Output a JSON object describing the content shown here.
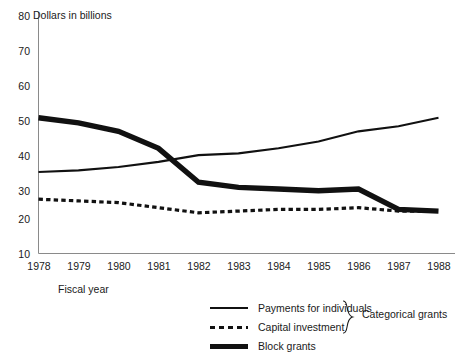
{
  "chart_data": {
    "type": "line",
    "title": "",
    "subtitle": "",
    "ylabel": "Dollars in billions",
    "xlabel": "Fiscal year",
    "x": [
      1978,
      1979,
      1980,
      1981,
      1982,
      1983,
      1984,
      1985,
      1986,
      1987,
      1988
    ],
    "categories": [
      "1978",
      "1979",
      "1980",
      "1981",
      "1982",
      "1983",
      "1984",
      "1985",
      "1986",
      "1987",
      "1988"
    ],
    "ylim": [
      10,
      80
    ],
    "yticks": [
      10,
      20,
      30,
      40,
      50,
      60,
      70,
      80
    ],
    "grid": false,
    "legend_position": "bottom-right",
    "series": [
      {
        "name": "Payments for individuals",
        "style": "solid-thin",
        "color": "#111111",
        "values": [
          34,
          34.5,
          35.5,
          37,
          39,
          39.5,
          41,
          43,
          46,
          47.5,
          50
        ]
      },
      {
        "name": "Capital investment",
        "style": "dotted",
        "color": "#111111",
        "values": [
          26,
          25.5,
          25,
          23.5,
          22,
          22.5,
          23,
          23,
          23.5,
          22.5,
          22.5
        ]
      },
      {
        "name": "Block grants",
        "style": "solid-thick",
        "color": "#111111",
        "values": [
          50,
          48.5,
          46,
          41,
          31,
          29.5,
          29,
          28.5,
          29,
          23,
          22.5
        ]
      }
    ],
    "annotations": [
      {
        "text": "Categorical grants",
        "type": "brace-group",
        "groups": [
          "Payments for individuals",
          "Capital investment"
        ]
      }
    ]
  },
  "legend": {
    "items": [
      {
        "label": "Payments for individuals",
        "style": "solid-thin"
      },
      {
        "label": "Capital investment",
        "style": "dotted"
      },
      {
        "label": "Block grants",
        "style": "solid-thick"
      }
    ],
    "group_label": "Categorical grants"
  },
  "axes": {
    "y_title": "Dollars in billions",
    "x_title": "Fiscal year",
    "y_tick_labels": [
      "80",
      "70",
      "60",
      "50",
      "40",
      "30",
      "20",
      "10"
    ],
    "x_tick_labels": [
      "1978",
      "1979",
      "1980",
      "1981",
      "1982",
      "1983",
      "1984",
      "1985",
      "1986",
      "1987",
      "1988"
    ]
  },
  "colors": {
    "line": "#111111",
    "axis": "#8a8a8a",
    "text": "#1a1a1a",
    "background": "#ffffff"
  }
}
